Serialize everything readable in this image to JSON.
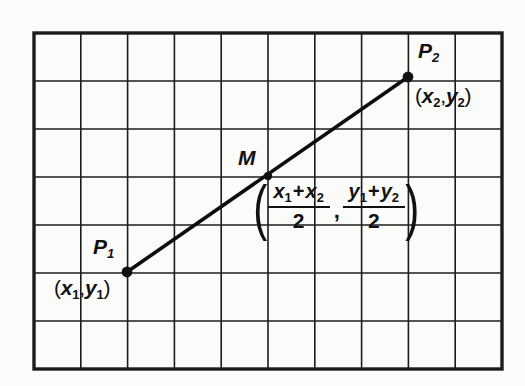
{
  "figure": {
    "background_color": "#fbfbf9",
    "ink_color": "#111111",
    "grid": {
      "columns": 10,
      "rows": 7,
      "cell_width": 46.8,
      "cell_height": 48.0,
      "left": 34,
      "top": 33,
      "right": 502,
      "bottom": 369,
      "line_color": "#1c1c1c",
      "line_width": 1.6,
      "border_width": 3.4
    },
    "segment": {
      "color": "#0d0d0d",
      "width": 3.6,
      "x1": 127,
      "y1": 272,
      "x2": 408,
      "y2": 77
    },
    "points": [
      {
        "id": "p1",
        "name": "P",
        "subscript": "1",
        "x": 127,
        "y": 272,
        "dot_radius": 5.4,
        "name_label": {
          "left": 93,
          "top": 236
        },
        "coord_open": "(",
        "coord_x": "x",
        "coord_x_sub": "1",
        "coord_comma": ",",
        "coord_y": "y",
        "coord_y_sub": "1",
        "coord_close": ")",
        "coord_label": {
          "left": 54,
          "top": 277
        }
      },
      {
        "id": "p2",
        "name": "P",
        "subscript": "2",
        "x": 408,
        "y": 77,
        "dot_radius": 5.4,
        "name_label": {
          "left": 418,
          "top": 40
        },
        "coord_open": "(",
        "coord_x": "x",
        "coord_x_sub": "2",
        "coord_comma": ",",
        "coord_y": "y",
        "coord_y_sub": "2",
        "coord_close": ")",
        "coord_label": {
          "left": 415,
          "top": 85
        }
      },
      {
        "id": "m",
        "name": "M",
        "subscript": "",
        "x": 268,
        "y": 176,
        "dot_radius": 4.2,
        "name_label": {
          "left": 238,
          "top": 147
        }
      }
    ],
    "midpoint_formula": {
      "open_paren": "(",
      "x_numerator_first": "x",
      "x_numerator_first_sub": "1",
      "x_numerator_op": "+",
      "x_numerator_second": "x",
      "x_numerator_second_sub": "2",
      "x_denominator": "2",
      "comma": ",",
      "y_numerator_first": "y",
      "y_numerator_first_sub": "1",
      "y_numerator_op": "+",
      "y_numerator_second": "y",
      "y_numerator_second_sub": "2",
      "y_denominator": "2",
      "close_paren": ")"
    }
  }
}
